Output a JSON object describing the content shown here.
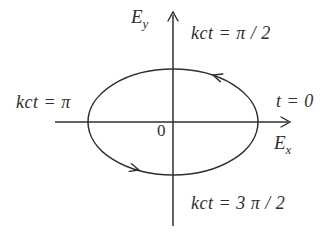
{
  "colors": {
    "background": "#ffffff",
    "ink": "#2f2f2f"
  },
  "labels": {
    "axis_y": {
      "base": "E",
      "sub": "y"
    },
    "axis_x": {
      "base": "E",
      "sub": "x"
    },
    "origin": "0",
    "phase_top": "kct = π / 2",
    "phase_left": "kct = π",
    "phase_bottom": "kct = 3 π / 2",
    "time_start": "t = 0"
  }
}
